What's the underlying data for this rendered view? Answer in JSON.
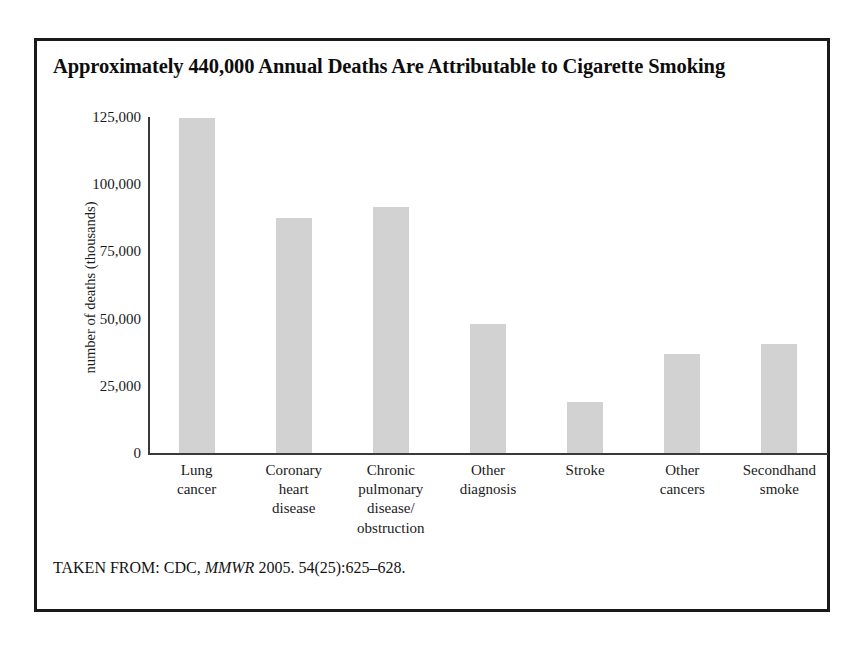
{
  "figure": {
    "title": "Approximately 440,000 Annual Deaths Are Attributable to Cigarette Smoking",
    "source_prefix": "TAKEN FROM: CDC, ",
    "source_journal": "MMWR",
    "source_suffix": " 2005. 54(25):625–628.",
    "border_color": "#1a1a1a",
    "bar_color": "#d2d2d2",
    "axis_color": "#3a3a3a"
  },
  "chart_data": {
    "type": "bar",
    "title": "Approximately 440,000 Annual Deaths Are Attributable to Cigarette Smoking",
    "xlabel": "",
    "ylabel": "number of deaths (thousands)",
    "ylim": [
      0,
      125000
    ],
    "grid": false,
    "legend": "none",
    "ytick_labels": [
      "0",
      "25,000",
      "50,000",
      "75,000",
      "100,000",
      "125,000"
    ],
    "ytick_values": [
      0,
      25000,
      50000,
      75000,
      100000,
      125000
    ],
    "categories": [
      "Lung\ncancer",
      "Coronary\nheart\ndisease",
      "Chronic\npulmonary\ndisease/\nobstruction",
      "Other\ndiagnosis",
      "Stroke",
      "Other\ncancers",
      "Secondhand\nsmoke"
    ],
    "values": [
      124500,
      87500,
      91500,
      48000,
      19000,
      37000,
      40500
    ]
  }
}
